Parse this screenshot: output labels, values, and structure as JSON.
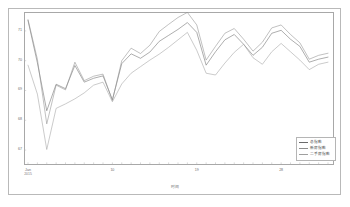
{
  "chart_data": {
    "type": "line",
    "title": "",
    "subtitle": "",
    "xlabel": "时间",
    "ylabel": "",
    "grid": false,
    "legend_position": "bottom-right",
    "ylim": [
      66.6,
      71.5
    ],
    "yticks": [
      67,
      68,
      69,
      70,
      71
    ],
    "ytick_labels": [
      "67",
      "68",
      "69",
      "70",
      "71"
    ],
    "x": [
      1,
      2,
      3,
      4,
      5,
      6,
      7,
      8,
      9,
      10,
      11,
      12,
      13,
      14,
      15,
      16,
      17,
      18,
      19,
      20,
      21,
      22,
      23,
      24,
      25,
      26,
      27,
      28,
      29,
      30,
      31,
      32,
      33
    ],
    "xticks": [
      1,
      10,
      19,
      28
    ],
    "xtick_labels": [
      "Jan",
      "10",
      "19",
      "28"
    ],
    "xtick_sublabels": [
      "2015",
      "",
      "",
      ""
    ],
    "axis_origin_label": {
      "line1": "Jan",
      "line2": "2015"
    },
    "series": [
      {
        "name": "总指数",
        "color": "#6b6b6b",
        "values": [
          71.35,
          69.93,
          68.32,
          69.21,
          69.06,
          69.84,
          69.28,
          69.41,
          69.49,
          68.69,
          69.9,
          70.23,
          70.08,
          70.29,
          70.65,
          70.85,
          71.05,
          71.28,
          70.95,
          69.85,
          70.3,
          70.7,
          70.88,
          70.55,
          70.18,
          70.45,
          70.92,
          71.02,
          70.72,
          70.48,
          69.95,
          70.05,
          70.12
        ]
      },
      {
        "name": "新房指数",
        "color": "#8d8d8d",
        "values": [
          71.38,
          70.05,
          67.88,
          69.18,
          69.02,
          69.95,
          69.33,
          69.48,
          69.55,
          68.66,
          70.0,
          70.42,
          70.24,
          70.52,
          70.98,
          71.22,
          71.45,
          71.62,
          71.2,
          70.02,
          70.48,
          70.92,
          71.08,
          70.72,
          70.32,
          70.62,
          71.1,
          71.2,
          70.88,
          70.6,
          70.05,
          70.18,
          70.25
        ]
      },
      {
        "name": "二手房指数",
        "color": "#9f9f9f",
        "values": [
          69.85,
          68.88,
          67.02,
          68.4,
          68.55,
          68.72,
          68.92,
          69.18,
          69.28,
          68.62,
          69.22,
          69.58,
          69.8,
          70.02,
          70.22,
          70.45,
          70.7,
          70.95,
          70.35,
          69.58,
          69.52,
          69.92,
          70.28,
          70.55,
          70.1,
          69.88,
          70.3,
          70.58,
          70.3,
          70.02,
          69.7,
          69.88,
          69.95
        ]
      }
    ],
    "legend_entries": [
      "总指数",
      "新房指数",
      "二手房指数"
    ]
  },
  "figure": {
    "background_color": "#ffffff",
    "frame_color": "#b9b9b9",
    "axis_color": "#a8a8a8",
    "tick_text_color": "#6d6d6d"
  }
}
